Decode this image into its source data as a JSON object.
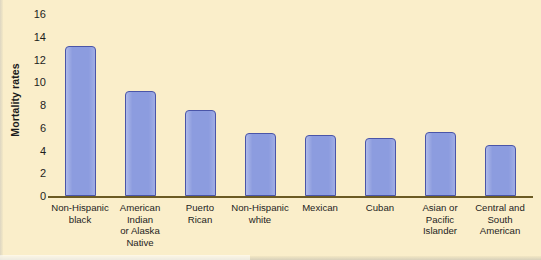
{
  "chart_data": {
    "type": "bar",
    "title": "",
    "xlabel": "",
    "ylabel": "Mortality rates",
    "ylim": [
      0,
      16
    ],
    "yticks": [
      0,
      2,
      4,
      6,
      8,
      10,
      12,
      14,
      16
    ],
    "grid": false,
    "legend": "none",
    "categories": [
      "Non-Hispanic black",
      "American Indian or Alaska Native",
      "Puerto Rican",
      "Non-Hispanic white",
      "Mexican",
      "Cuban",
      "Asian or Pacific Islander",
      "Central and South American"
    ],
    "category_lines": [
      [
        "Non-Hispanic",
        "black"
      ],
      [
        "American",
        "Indian",
        "or Alaska",
        "Native"
      ],
      [
        "Puerto",
        "Rican"
      ],
      [
        "Non-Hispanic",
        "white"
      ],
      [
        "Mexican"
      ],
      [
        "Cuban"
      ],
      [
        "Asian or",
        "Pacific",
        "Islander"
      ],
      [
        "Central and",
        "South",
        "American"
      ]
    ],
    "values": [
      13.2,
      9.2,
      7.6,
      5.5,
      5.4,
      5.1,
      5.6,
      4.5
    ],
    "colors": {
      "bar_fill": "#8c9cdf",
      "bar_border": "#4a55a8",
      "background": "#faeeca",
      "axis_line": "#6b5a23",
      "text": "#1d1d1d"
    }
  }
}
